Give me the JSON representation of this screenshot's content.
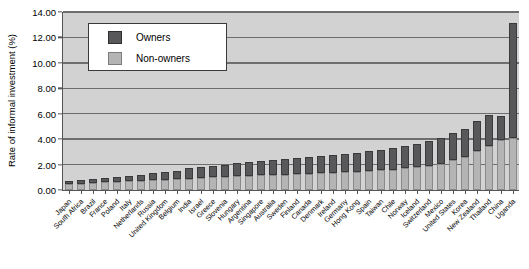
{
  "chart_data": {
    "type": "bar",
    "subtype": "stacked-bar",
    "title": "",
    "xlabel": "",
    "ylabel": "Rate of informal investment (%)",
    "ylim": [
      0,
      14
    ],
    "ytick_values": [
      0,
      2,
      4,
      6,
      8,
      10,
      12,
      14
    ],
    "ytick_labels": [
      "0.00",
      "2.00",
      "4.00",
      "6.00",
      "8.00",
      "10.00",
      "12.00",
      "14.00"
    ],
    "grid": true,
    "grid_axis": "y",
    "legend_position": "upper-left-inset",
    "categories": [
      "Japan",
      "South Africa",
      "Brazil",
      "France",
      "Poland",
      "Italy",
      "Netherlands",
      "Russia",
      "United Kingdom",
      "Belgium",
      "India",
      "Israel",
      "Greece",
      "Slovenia",
      "Hungary",
      "Argentina",
      "Singapore",
      "Australia",
      "Sweden",
      "Finland",
      "Canada",
      "Denmark",
      "Ireland",
      "Germany",
      "Hong Kong",
      "Spain",
      "Taiwan",
      "Chile",
      "Norway",
      "Iceland",
      "Switzerland",
      "Mexico",
      "United States",
      "Korea",
      "New Zealand",
      "Thailand",
      "China",
      "Uganda"
    ],
    "series": [
      {
        "name": "Non-owners",
        "color": "#b4b4b4",
        "values": [
          0.45,
          0.5,
          0.55,
          0.6,
          0.62,
          0.68,
          0.72,
          0.78,
          0.8,
          0.85,
          0.88,
          0.95,
          1.0,
          1.05,
          1.1,
          1.12,
          1.15,
          1.18,
          1.22,
          1.25,
          1.28,
          1.3,
          1.35,
          1.4,
          1.45,
          1.48,
          1.55,
          1.6,
          1.7,
          1.8,
          1.9,
          2.05,
          2.4,
          2.6,
          3.1,
          3.5,
          3.95,
          4.1
        ]
      },
      {
        "name": "Owners",
        "color": "#58585a",
        "values": [
          0.25,
          0.28,
          0.32,
          0.35,
          0.4,
          0.45,
          0.5,
          0.55,
          0.6,
          0.68,
          0.82,
          0.85,
          0.9,
          0.95,
          1.0,
          1.08,
          1.12,
          1.17,
          1.2,
          1.25,
          1.3,
          1.38,
          1.42,
          1.45,
          1.5,
          1.58,
          1.62,
          1.72,
          1.8,
          1.85,
          1.95,
          2.05,
          2.1,
          2.2,
          2.3,
          2.4,
          1.85,
          9.0
        ]
      }
    ],
    "totals": [
      0.7,
      0.78,
      0.87,
      0.95,
      1.02,
      1.13,
      1.22,
      1.33,
      1.4,
      1.53,
      1.7,
      1.8,
      1.9,
      2.0,
      2.1,
      2.2,
      2.27,
      2.35,
      2.42,
      2.5,
      2.58,
      2.68,
      2.77,
      2.85,
      2.95,
      3.06,
      3.17,
      3.32,
      3.5,
      3.65,
      3.85,
      4.1,
      4.5,
      4.8,
      5.4,
      5.9,
      5.8,
      13.1
    ]
  },
  "legend": {
    "items": [
      {
        "label": "Owners",
        "color": "#58585a"
      },
      {
        "label": "Non-owners",
        "color": "#b4b4b4"
      }
    ]
  },
  "axes": {
    "y_title": "Rate of informal investment (%)"
  }
}
